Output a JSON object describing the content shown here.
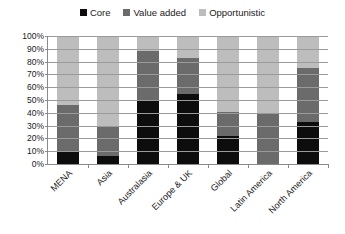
{
  "chart_data": {
    "type": "bar",
    "subtype": "stacked-100-percent",
    "title": "",
    "xlabel": "",
    "ylabel": "",
    "ylim": [
      0,
      100
    ],
    "ytick_labels": [
      "100%",
      "90%",
      "80%",
      "70%",
      "60%",
      "50%",
      "40%",
      "30%",
      "20%",
      "10%",
      "0%"
    ],
    "ytick_values": [
      100,
      90,
      80,
      70,
      60,
      50,
      40,
      30,
      20,
      10,
      0
    ],
    "grid": true,
    "legend_position": "top-center",
    "categories": [
      "MENA",
      "Asia",
      "Australasia",
      "Europe & UK",
      "Global",
      "Latin America",
      "North America"
    ],
    "series": [
      {
        "name": "Core",
        "color": "#0d0d0d",
        "values": [
          9,
          6,
          50,
          55,
          22,
          0,
          33
        ]
      },
      {
        "name": "Value added",
        "color": "#6b6b6b",
        "values": [
          37,
          23,
          38,
          28,
          19,
          40,
          42
        ]
      },
      {
        "name": "Opportunistic",
        "color": "#bdbdbd",
        "values": [
          54,
          71,
          12,
          17,
          59,
          60,
          25
        ]
      }
    ]
  },
  "legend": {
    "entries": [
      {
        "label": "Core",
        "color": "#0d0d0d"
      },
      {
        "label": "Value added",
        "color": "#6b6b6b"
      },
      {
        "label": "Opportunistic",
        "color": "#bdbdbd"
      }
    ]
  },
  "colors": {
    "core": "#0d0d0d",
    "value_added": "#6b6b6b",
    "opportunistic": "#bdbdbd",
    "axis": "#8a8a8a",
    "gridline": "#9a9a9a",
    "text": "#1a1a1a",
    "background": "#ffffff"
  }
}
